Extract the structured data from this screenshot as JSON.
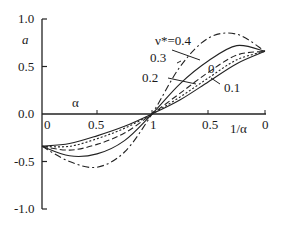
{
  "chart_data": {
    "type": "line",
    "title": "",
    "ylabel": "a",
    "xlabel_left": "α",
    "xlabel_right": "1/α",
    "ylim": [
      -1.0,
      1.0
    ],
    "yticks": [
      "1.0",
      "0.5",
      "0.0",
      "-0.5",
      "-1.0"
    ],
    "xticks_left": [
      "0",
      "0.5",
      "1"
    ],
    "xticks_right": [
      "0.5",
      "0"
    ],
    "grid": false,
    "legend_position": "inline annotations",
    "parameter": "ν*",
    "annotations": [
      "ν*=0.4",
      "0.3",
      "0.2",
      "0",
      "0.1"
    ],
    "x_note": "left half α from 0 to 1, right half 1/α from 1 to 0; u = position 0..2",
    "u": [
      0,
      0.25,
      0.5,
      0.75,
      1.0,
      1.25,
      1.5,
      1.75,
      2.0
    ],
    "series": [
      {
        "name": "ν*=0.4",
        "style": "dash-dot",
        "values": [
          -0.34,
          -0.5,
          -0.56,
          -0.4,
          0.0,
          0.5,
          0.8,
          0.84,
          0.66
        ]
      },
      {
        "name": "0.3",
        "style": "solid",
        "values": [
          -0.34,
          -0.44,
          -0.42,
          -0.28,
          0.0,
          0.32,
          0.56,
          0.72,
          0.66
        ]
      },
      {
        "name": "0.2",
        "style": "dashed",
        "values": [
          -0.34,
          -0.38,
          -0.32,
          -0.2,
          0.0,
          0.22,
          0.44,
          0.62,
          0.66
        ]
      },
      {
        "name": "0.1",
        "style": "dotted",
        "values": [
          -0.34,
          -0.34,
          -0.26,
          -0.15,
          0.0,
          0.18,
          0.38,
          0.57,
          0.66
        ]
      },
      {
        "name": "0",
        "style": "solid",
        "values": [
          -0.34,
          -0.31,
          -0.23,
          -0.13,
          0.0,
          0.15,
          0.34,
          0.53,
          0.66
        ]
      }
    ]
  },
  "labels": {
    "y_axis": "a",
    "x_left": "α",
    "x_right": "1/α",
    "y_ticks": [
      "1.0",
      "0.5",
      "0.0",
      "-0.5",
      "-1.0"
    ],
    "x_ticks_left": [
      "0",
      "0.5",
      "1"
    ],
    "x_ticks_right": [
      "0.5",
      "0"
    ],
    "ann_04": "ν*=0.4",
    "ann_03": "0.3",
    "ann_02": "0.2",
    "ann_0": "0",
    "ann_01": "0.1"
  }
}
